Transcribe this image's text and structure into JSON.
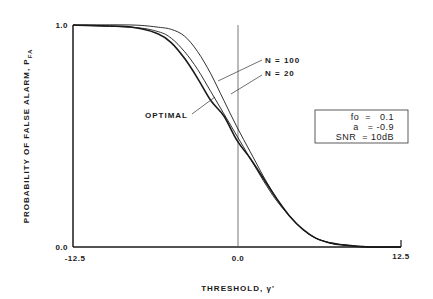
{
  "chart_data": {
    "type": "line",
    "title": "",
    "xlabel": "THRESHOLD, γ'",
    "ylabel": "PROBABILITY OF FALSE ALARM, P_FA",
    "ylabel_main": "PROBABILITY OF FALSE ALARM, P",
    "ylabel_sub": "FA",
    "xlim": [
      -12.5,
      12.5
    ],
    "ylim": [
      0.0,
      1.0
    ],
    "x_ticks": [
      "-12.5",
      "0.0",
      "12.5"
    ],
    "y_ticks": [
      "0.0",
      "1.0"
    ],
    "grid": false,
    "vertical_reference_line_x": 0.0,
    "series": [
      {
        "name": "OPTIMAL",
        "x": [
          -12.5,
          -8,
          -6,
          -5,
          -4,
          -3,
          -2,
          -1,
          0,
          1,
          2,
          3,
          4,
          5,
          6,
          7,
          8,
          10,
          12.5
        ],
        "y": [
          1.0,
          0.99,
          0.96,
          0.92,
          0.85,
          0.76,
          0.66,
          0.59,
          0.48,
          0.4,
          0.31,
          0.22,
          0.14,
          0.08,
          0.04,
          0.02,
          0.01,
          0.0,
          0.0
        ]
      },
      {
        "name": "N = 20",
        "x": [
          -12.5,
          -8,
          -6,
          -5,
          -4,
          -3,
          -2,
          -1,
          0,
          1,
          2,
          3,
          4,
          5,
          6,
          7,
          8,
          10,
          12.5
        ],
        "y": [
          1.0,
          0.99,
          0.97,
          0.94,
          0.88,
          0.8,
          0.7,
          0.6,
          0.5,
          0.4,
          0.3,
          0.21,
          0.14,
          0.08,
          0.04,
          0.02,
          0.01,
          0.0,
          0.0
        ]
      },
      {
        "name": "N = 100",
        "x": [
          -12.5,
          -8,
          -6,
          -5,
          -4,
          -3,
          -2,
          -1,
          0,
          1,
          2,
          3,
          4,
          5,
          6,
          7,
          8,
          10,
          12.5
        ],
        "y": [
          1.0,
          1.0,
          0.99,
          0.98,
          0.95,
          0.88,
          0.78,
          0.66,
          0.54,
          0.43,
          0.32,
          0.22,
          0.14,
          0.08,
          0.04,
          0.02,
          0.01,
          0.0,
          0.0
        ]
      }
    ],
    "annotations": [
      "N = 100",
      "N = 20",
      "OPTIMAL"
    ],
    "parameter_box": [
      {
        "name": "fo",
        "eq": "=",
        "value": "0.1"
      },
      {
        "name": "a",
        "eq": "=",
        "value": "-0.9"
      },
      {
        "name": "SNR",
        "eq": "=",
        "value": "10dB"
      }
    ]
  },
  "labels": {
    "n100": "N = 100",
    "n20": "N = 20",
    "optimal": "OPTIMAL",
    "xtick_left": "-12.5",
    "xtick_mid": "0.0",
    "xtick_right": "12.5",
    "ytick_top": "1.0",
    "ytick_bottom": "0.0",
    "xlabel": "THRESHOLD, γ'",
    "ylabel_main": "PROBABILITY OF FALSE ALARM, P",
    "ylabel_sub": "FA",
    "box_line1": "fo  =   0.1",
    "box_line2": "a   = -0.9",
    "box_line3": "SNR  = 10dB"
  }
}
